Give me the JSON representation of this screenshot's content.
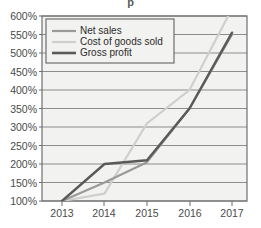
{
  "chart_data": {
    "type": "line",
    "title": "",
    "xlabel": "",
    "ylabel": "",
    "categories": [
      "2013",
      "2014",
      "2015",
      "2016",
      "2017"
    ],
    "x": [
      2013,
      2014,
      2015,
      2016,
      2017
    ],
    "ylim": [
      100,
      600
    ],
    "ytick_labels": [
      "100%",
      "150%",
      "200%",
      "250%",
      "300%",
      "350%",
      "400%",
      "450%",
      "500%",
      "550%",
      "600%"
    ],
    "ytick_values": [
      100,
      150,
      200,
      250,
      300,
      350,
      400,
      450,
      500,
      550,
      600
    ],
    "grid": true,
    "legend_position": "top-left",
    "series": [
      {
        "name": "Net sales",
        "color": "#9a9a9a",
        "values": [
          100,
          150,
          205,
          350,
          550
        ]
      },
      {
        "name": "Cost of goods sold",
        "color": "#cfcfcf",
        "values": [
          100,
          120,
          310,
          400,
          620
        ]
      },
      {
        "name": "Gross profit",
        "color": "#5a5a5a",
        "values": [
          100,
          200,
          210,
          350,
          555
        ]
      }
    ]
  },
  "axis": {
    "y_labels": [
      "600%",
      "550%",
      "500%",
      "450%",
      "400%",
      "350%",
      "300%",
      "250%",
      "200%",
      "150%",
      "100%"
    ],
    "x_labels": [
      "2013",
      "2014",
      "2015",
      "2016",
      "2017"
    ]
  },
  "legend": {
    "entries": [
      {
        "label": "Net sales"
      },
      {
        "label": "Cost of goods sold"
      },
      {
        "label": "Gross profit"
      }
    ]
  },
  "colors": {
    "net_sales": "#9a9a9a",
    "cost_of_goods_sold": "#cfcfcf",
    "gross_profit": "#5a5a5a",
    "grid": "#8c8c8c",
    "frame": "#6e6e6e",
    "plot_background": "#f2f2f0",
    "tick_text": "#4a4a4a"
  },
  "cropped_header": {
    "text": "p"
  }
}
